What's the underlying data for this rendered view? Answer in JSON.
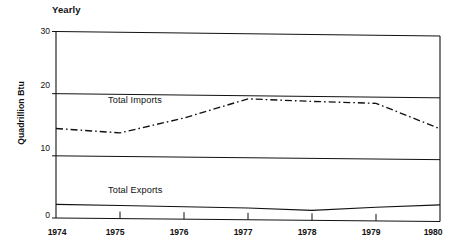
{
  "chart_data": {
    "type": "line",
    "title": "Yearly",
    "xlabel": "",
    "ylabel": "Quadrillion Btu",
    "x": [
      1974,
      1975,
      1976,
      1977,
      1978,
      1979,
      1980
    ],
    "xtick_labels": [
      "1974",
      "1975",
      "1976",
      "1977",
      "1978",
      "1979",
      "1980"
    ],
    "ytick_labels": [
      "0",
      "10",
      "20",
      "30"
    ],
    "yticks": [
      0,
      10,
      20,
      30
    ],
    "ylim": [
      0,
      30
    ],
    "xlim": [
      1974,
      1980
    ],
    "grid": "horizontal-gridlines-at-10-20-30",
    "legend": "inline-labels",
    "series": [
      {
        "name": "Total Imports",
        "style": "dash-dot",
        "color": "#111111",
        "values": [
          14.4,
          13.8,
          16.3,
          19.5,
          19.2,
          19.0,
          15.0
        ]
      },
      {
        "name": "Total Exports",
        "style": "solid",
        "color": "#111111",
        "values": [
          2.2,
          2.1,
          2.0,
          1.9,
          1.6,
          2.2,
          2.7
        ]
      }
    ]
  },
  "labels": {
    "title": "Yearly",
    "y_axis_title": "Quadrillion Btu",
    "imports_label": "Total Imports",
    "exports_label": "Total Exports",
    "y0": "0",
    "y10": "10",
    "y20": "20",
    "y30": "30",
    "x1974": "1974",
    "x1975": "1975",
    "x1976": "1976",
    "x1977": "1977",
    "x1978": "1978",
    "x1979": "1979",
    "x1980": "1980"
  },
  "colors": {
    "ink": "#111111",
    "background": "#ffffff"
  }
}
